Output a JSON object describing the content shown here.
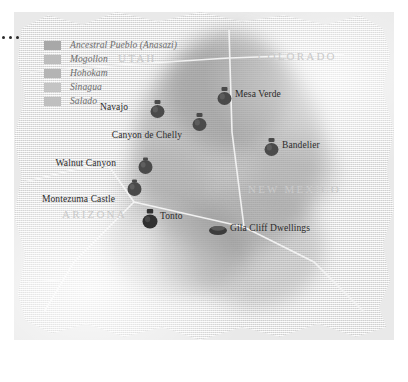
{
  "map": {
    "title": "Southwest Ancestral Cultures Map",
    "background_color": "#ececec",
    "texture": "woven-canvas"
  },
  "legend": {
    "items": [
      {
        "label": "Ancestral Pueblo (Anasazi)",
        "swatch_color": "#a8a8a8"
      },
      {
        "label": "Mogollon",
        "swatch_color": "#bdbdbd"
      },
      {
        "label": "Hohokam",
        "swatch_color": "#b4b4b4"
      },
      {
        "label": "Sinagua",
        "swatch_color": "#c4c4c4"
      },
      {
        "label": "Salado",
        "swatch_color": "#bfbfbf"
      }
    ]
  },
  "states": [
    {
      "name": "UTAH"
    },
    {
      "name": "COLORADO"
    },
    {
      "name": "NEW MEXICO"
    },
    {
      "name": "ARIZONA"
    }
  ],
  "sites": [
    {
      "name": "Mesa Verde",
      "icon": "pot-icon",
      "label_position": "right"
    },
    {
      "name": "Navajo",
      "icon": "pot-icon",
      "label_position": "left"
    },
    {
      "name": "Canyon de Chelly",
      "icon": "pot-icon",
      "label_position": "below-left"
    },
    {
      "name": "Bandelier",
      "icon": "pot-icon",
      "label_position": "right"
    },
    {
      "name": "Walnut Canyon",
      "icon": "ball-pot-icon",
      "label_position": "left"
    },
    {
      "name": "Montezuma Castle",
      "icon": "ball-pot-icon",
      "label_position": "below-left"
    },
    {
      "name": "Tonto",
      "icon": "pot-icon",
      "label_position": "right"
    },
    {
      "name": "Gila Cliff Dwellings",
      "icon": "bowl-icon",
      "label_position": "right"
    }
  ],
  "colors": {
    "marker_dark": "#3a3a3a",
    "marker_mid": "#5a5a5a",
    "state_label": "#c9c9c9",
    "legend_text": "#6d6d6d",
    "site_text": "#2b2b2b"
  }
}
